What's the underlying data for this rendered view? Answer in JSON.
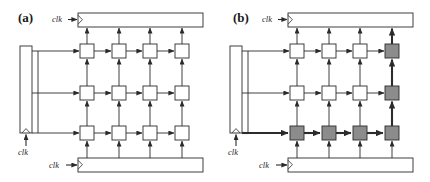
{
  "figure": {
    "panels": [
      {
        "id": "a",
        "label": "(a)",
        "label_x": 18,
        "label_y": 21,
        "origin_x": 0,
        "clocks": [
          {
            "name": "clk-top",
            "text": "clk",
            "x": 52,
            "y": 22
          },
          {
            "name": "clk-left",
            "text": "clk",
            "x": 18,
            "y": 150
          },
          {
            "name": "clk-bottom",
            "text": "clk",
            "x": 49,
            "y": 168
          }
        ],
        "registers": [
          {
            "name": "top-register",
            "x": 78,
            "y": 13,
            "w": 125,
            "h": 14,
            "orient": "horizontal"
          },
          {
            "name": "left-register",
            "x": 20,
            "y": 46,
            "w": 12,
            "h": 87,
            "orient": "vertical"
          },
          {
            "name": "bottom-register",
            "x": 78,
            "y": 158,
            "w": 125,
            "h": 14,
            "orient": "horizontal"
          }
        ],
        "cells": [
          {
            "name": "cell-r0-c0",
            "row": 0,
            "col": 0,
            "x": 80,
            "y": 44,
            "w": 14,
            "h": 14,
            "shaded": false
          },
          {
            "name": "cell-r0-c1",
            "row": 0,
            "col": 1,
            "x": 112,
            "y": 44,
            "w": 14,
            "h": 14,
            "shaded": false
          },
          {
            "name": "cell-r0-c2",
            "row": 0,
            "col": 2,
            "x": 143,
            "y": 44,
            "w": 14,
            "h": 14,
            "shaded": false
          },
          {
            "name": "cell-r0-c3",
            "row": 0,
            "col": 3,
            "x": 175,
            "y": 44,
            "w": 14,
            "h": 14,
            "shaded": false
          },
          {
            "name": "cell-r1-c0",
            "row": 1,
            "col": 0,
            "x": 80,
            "y": 86,
            "w": 14,
            "h": 14,
            "shaded": false
          },
          {
            "name": "cell-r1-c1",
            "row": 1,
            "col": 1,
            "x": 112,
            "y": 86,
            "w": 14,
            "h": 14,
            "shaded": false
          },
          {
            "name": "cell-r1-c2",
            "row": 1,
            "col": 2,
            "x": 143,
            "y": 86,
            "w": 14,
            "h": 14,
            "shaded": false
          },
          {
            "name": "cell-r1-c3",
            "row": 1,
            "col": 3,
            "x": 175,
            "y": 86,
            "w": 14,
            "h": 14,
            "shaded": false
          },
          {
            "name": "cell-r2-c0",
            "row": 2,
            "col": 0,
            "x": 80,
            "y": 126,
            "w": 14,
            "h": 14,
            "shaded": false
          },
          {
            "name": "cell-r2-c1",
            "row": 2,
            "col": 1,
            "x": 112,
            "y": 126,
            "w": 14,
            "h": 14,
            "shaded": false
          },
          {
            "name": "cell-r2-c2",
            "row": 2,
            "col": 2,
            "x": 143,
            "y": 126,
            "w": 14,
            "h": 14,
            "shaded": false
          },
          {
            "name": "cell-r2-c3",
            "row": 2,
            "col": 3,
            "x": 175,
            "y": 126,
            "w": 14,
            "h": 14,
            "shaded": false
          }
        ],
        "bold_paths": []
      },
      {
        "id": "b",
        "label": "(b)",
        "label_x": 233,
        "label_y": 21,
        "origin_x": 215,
        "clocks": [
          {
            "name": "clk-top",
            "text": "clk",
            "x": 258,
            "y": 22
          },
          {
            "name": "clk-left",
            "text": "clk",
            "x": 228,
            "y": 150
          },
          {
            "name": "clk-bottom",
            "text": "clk",
            "x": 259,
            "y": 168
          }
        ],
        "registers": [
          {
            "name": "top-register",
            "x": 288,
            "y": 13,
            "w": 125,
            "h": 14,
            "orient": "horizontal"
          },
          {
            "name": "left-register",
            "x": 230,
            "y": 46,
            "w": 12,
            "h": 87,
            "orient": "vertical"
          },
          {
            "name": "bottom-register",
            "x": 288,
            "y": 158,
            "w": 125,
            "h": 14,
            "orient": "horizontal"
          }
        ],
        "cells": [
          {
            "name": "cell-r0-c0",
            "row": 0,
            "col": 0,
            "x": 290,
            "y": 44,
            "w": 14,
            "h": 14,
            "shaded": false
          },
          {
            "name": "cell-r0-c1",
            "row": 0,
            "col": 1,
            "x": 322,
            "y": 44,
            "w": 14,
            "h": 14,
            "shaded": false
          },
          {
            "name": "cell-r0-c2",
            "row": 0,
            "col": 2,
            "x": 353,
            "y": 44,
            "w": 14,
            "h": 14,
            "shaded": false
          },
          {
            "name": "cell-r0-c3",
            "row": 0,
            "col": 3,
            "x": 385,
            "y": 44,
            "w": 14,
            "h": 14,
            "shaded": true
          },
          {
            "name": "cell-r1-c0",
            "row": 1,
            "col": 0,
            "x": 290,
            "y": 86,
            "w": 14,
            "h": 14,
            "shaded": false
          },
          {
            "name": "cell-r1-c1",
            "row": 1,
            "col": 1,
            "x": 322,
            "y": 86,
            "w": 14,
            "h": 14,
            "shaded": false
          },
          {
            "name": "cell-r1-c2",
            "row": 1,
            "col": 2,
            "x": 353,
            "y": 86,
            "w": 14,
            "h": 14,
            "shaded": false
          },
          {
            "name": "cell-r1-c3",
            "row": 1,
            "col": 3,
            "x": 385,
            "y": 86,
            "w": 14,
            "h": 14,
            "shaded": true
          },
          {
            "name": "cell-r2-c0",
            "row": 2,
            "col": 0,
            "x": 290,
            "y": 126,
            "w": 14,
            "h": 14,
            "shaded": true
          },
          {
            "name": "cell-r2-c1",
            "row": 2,
            "col": 1,
            "x": 322,
            "y": 126,
            "w": 14,
            "h": 14,
            "shaded": true
          },
          {
            "name": "cell-r2-c2",
            "row": 2,
            "col": 2,
            "x": 353,
            "y": 126,
            "w": 14,
            "h": 14,
            "shaded": true
          },
          {
            "name": "cell-r2-c3",
            "row": 2,
            "col": 3,
            "x": 385,
            "y": 126,
            "w": 14,
            "h": 14,
            "shaded": true
          }
        ],
        "bold_paths": [
          "bottom-row-horizontal",
          "right-column-vertical",
          "left-register-to-bottom-row"
        ]
      }
    ],
    "colors": {
      "stroke": "#2b2b2b",
      "cell_fill_plain": "#ffffff",
      "cell_fill_shaded": "#8c8c8c",
      "register_fill": "#ffffff",
      "background": "#ffffff"
    },
    "line_widths": {
      "normal": 0.9,
      "bold": 2.1,
      "box": 0.9
    },
    "grid": {
      "rows": 3,
      "cols": 4,
      "col_spacing": 31.6,
      "row_spacing": 41
    }
  }
}
